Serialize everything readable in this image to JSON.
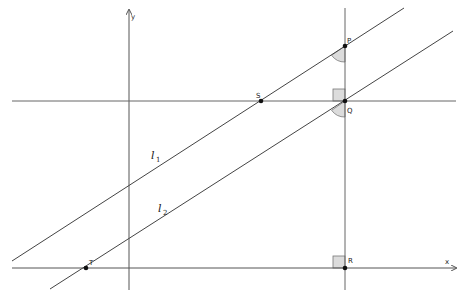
{
  "diagram": {
    "axes": {
      "x_label": "x",
      "y_label": "y"
    },
    "points": {
      "P": {
        "label": "P"
      },
      "Q": {
        "label": "Q"
      },
      "S": {
        "label": "S"
      },
      "T": {
        "label": "T"
      },
      "R": {
        "label": "R"
      }
    },
    "lines": {
      "l1": {
        "label": "l",
        "subscript": "1"
      },
      "l2": {
        "label": "l",
        "subscript": "2"
      }
    },
    "markers": {
      "right_angle_Q": "right angle at Q",
      "right_angle_R": "right angle at R",
      "angle_P": "angle at P",
      "angle_Q": "angle at Q"
    },
    "colors": {
      "line": "#555555",
      "point": "#111111",
      "angle_fill": "#d9d9d9"
    }
  }
}
